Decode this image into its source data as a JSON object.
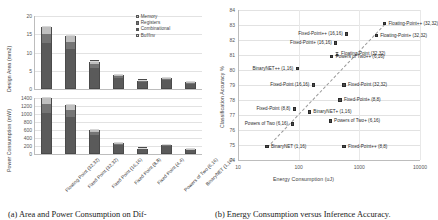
{
  "figure": {
    "caption_a": "(a)  Area and Power Consumption on Dif-",
    "caption_b": "(b)  Energy Consumption versus Inference Accuracy."
  },
  "panel_a": {
    "legend": [
      {
        "label": "Memory",
        "color": "#bfbfbf"
      },
      {
        "label": "Registers",
        "color": "#757575"
      },
      {
        "label": "Combinational",
        "color": "#5a5a5a"
      },
      {
        "label": "Buf/Inv",
        "color": "#d8d8d8"
      }
    ],
    "categories": [
      "Floating Point (32,32)",
      "Fixed Point (32,32)",
      "Fixed Point (16,16)",
      "Fixed Point (8,8)",
      "Fixed Point (4,4)",
      "Powers of Two (6,16)",
      "BinaryNET (1,16)"
    ]
  },
  "chart_data": [
    {
      "type": "bar",
      "title": "",
      "xlabel": "",
      "ylabel": "Design Area (mm2)",
      "ylim": [
        0,
        20
      ],
      "yticks": [
        0,
        5,
        10,
        15,
        20
      ],
      "grid": true,
      "stacked": true,
      "categories": [
        "Floating Point (32,32)",
        "Fixed Point (32,32)",
        "Fixed Point (16,16)",
        "Fixed Point (8,8)",
        "Fixed Point (4,4)",
        "Powers of Two (6,16)",
        "BinaryNET (1,16)"
      ],
      "series": [
        {
          "name": "Combinational",
          "values": [
            12.4,
            10.6,
            5.6,
            2.7,
            1.6,
            2.1,
            1.2
          ]
        },
        {
          "name": "Registers",
          "values": [
            2.3,
            2.0,
            1.1,
            0.6,
            0.4,
            0.5,
            0.3
          ]
        },
        {
          "name": "Memory",
          "values": [
            2.0,
            1.6,
            0.7,
            0.4,
            0.2,
            0.3,
            0.2
          ]
        },
        {
          "name": "Buf/Inv",
          "values": [
            0.3,
            0.3,
            0.1,
            0.1,
            0.1,
            0.1,
            0.1
          ]
        }
      ],
      "totals": [
        17.0,
        14.5,
        7.5,
        3.8,
        2.3,
        3.0,
        1.8
      ]
    },
    {
      "type": "bar",
      "title": "",
      "xlabel": "",
      "ylabel": "Power Consumption (mW)",
      "ylim": [
        0,
        1400
      ],
      "yticks": [
        0,
        200,
        400,
        600,
        800,
        1000,
        1200,
        1400
      ],
      "grid": true,
      "stacked": true,
      "categories": [
        "Floating Point (32,32)",
        "Fixed Point (32,32)",
        "Fixed Point (16,16)",
        "Fixed Point (8,8)",
        "Fixed Point (4,4)",
        "Powers of Two (6,16)",
        "BinaryNET (1,16)"
      ],
      "series": [
        {
          "name": "Combinational",
          "values": [
            1010,
            900,
            440,
            190,
            95,
            165,
            80
          ]
        },
        {
          "name": "Registers",
          "values": [
            210,
            175,
            85,
            40,
            20,
            35,
            18
          ]
        },
        {
          "name": "Memory",
          "values": [
            150,
            120,
            60,
            25,
            15,
            22,
            12
          ]
        },
        {
          "name": "Buf/Inv",
          "values": [
            30,
            25,
            15,
            10,
            5,
            8,
            5
          ]
        }
      ],
      "totals": [
        1400,
        1220,
        600,
        265,
        135,
        230,
        115
      ]
    },
    {
      "type": "scatter",
      "title": "",
      "xlabel": "Energy Consumption (uJ)",
      "ylabel": "Classification Accuracy %",
      "xscale": "log",
      "xlim": [
        10,
        10000
      ],
      "xticks": [
        10,
        100,
        1000,
        10000
      ],
      "xticklabels": [
        "10",
        "100",
        "1000",
        "10000"
      ],
      "ylim": [
        74,
        84
      ],
      "yticks": [
        74,
        75,
        76,
        77,
        78,
        79,
        80,
        81,
        82,
        83,
        84
      ],
      "grid": true,
      "points": [
        {
          "label": "Floating-Point++ (32,32)",
          "x": 2600,
          "y": 83.1,
          "marker": "square",
          "label_pos": "right"
        },
        {
          "label": "Floating-Point+ (32,32)",
          "x": 1900,
          "y": 82.3,
          "marker": "square",
          "label_pos": "right"
        },
        {
          "label": "Fixed-Point++ (16,16)",
          "x": 620,
          "y": 82.4,
          "marker": "square",
          "label_pos": "left"
        },
        {
          "label": "Fixed-Point+ (16,16)",
          "x": 410,
          "y": 81.8,
          "marker": "square",
          "label_pos": "left"
        },
        {
          "label": "Floating-Point (32,32)",
          "x": 430,
          "y": 81.1,
          "marker": "triangle",
          "label_pos": "right"
        },
        {
          "label": "Powers of Two++ (6,16)",
          "x": 350,
          "y": 80.9,
          "marker": "square",
          "label_pos": "right"
        },
        {
          "label": "BinaryNET++ (1,16)",
          "x": 95,
          "y": 80.1,
          "marker": "square",
          "label_pos": "left"
        },
        {
          "label": "Fixed-Point (16,16)",
          "x": 175,
          "y": 79.0,
          "marker": "square",
          "label_pos": "left"
        },
        {
          "label": "Fixed-Point (32,32)",
          "x": 560,
          "y": 79.0,
          "marker": "square",
          "label_pos": "right"
        },
        {
          "label": "Fixed-Point+ (8,8)",
          "x": 480,
          "y": 78.0,
          "marker": "square",
          "label_pos": "right"
        },
        {
          "label": "Fixed-Point (8,8)",
          "x": 85,
          "y": 77.4,
          "marker": "square",
          "label_pos": "left"
        },
        {
          "label": "BinaryNET+ (1,16)",
          "x": 150,
          "y": 77.2,
          "marker": "square",
          "label_pos": "right"
        },
        {
          "label": "Powers of Two+ (6,16)",
          "x": 330,
          "y": 76.6,
          "marker": "square",
          "label_pos": "right"
        },
        {
          "label": "Powers of Two (6,16)",
          "x": 78,
          "y": 76.4,
          "marker": "square",
          "label_pos": "left"
        },
        {
          "label": "BinaryNET (1,16)",
          "x": 30,
          "y": 74.9,
          "marker": "square",
          "label_pos": "right"
        },
        {
          "label": "Fixed-Point++ (8,8)",
          "x": 560,
          "y": 74.9,
          "marker": "square",
          "label_pos": "right"
        }
      ],
      "trend": {
        "style": "dashed",
        "from": [
          30,
          74.9
        ],
        "to": [
          2600,
          83.1
        ]
      }
    }
  ]
}
